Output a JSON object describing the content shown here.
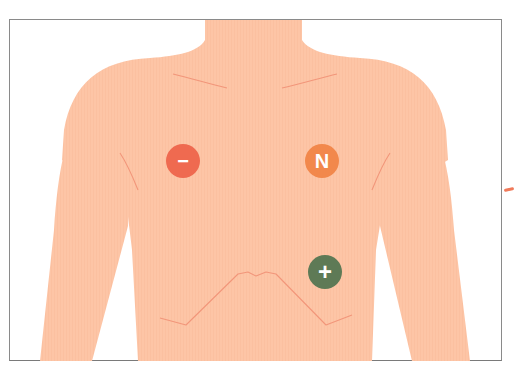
{
  "figure": {
    "title": "",
    "colors": {
      "skin": "#fdc5a6",
      "skin_line": "#f2967a",
      "frame": "#8a8a8a",
      "background": "#ffffff"
    }
  },
  "electrodes": [
    {
      "id": "negative",
      "label": "−",
      "position": "right upper chest (viewer's left)",
      "color": "#ef6a50",
      "cx": 183,
      "cy": 161
    },
    {
      "id": "neutral",
      "label": "N",
      "position": "left upper chest (viewer's right)",
      "color": "#f2884c",
      "cx": 322,
      "cy": 161
    },
    {
      "id": "positive",
      "label": "+",
      "position": "left lower chest",
      "color": "#5e7a56",
      "cx": 325,
      "cy": 272
    }
  ]
}
